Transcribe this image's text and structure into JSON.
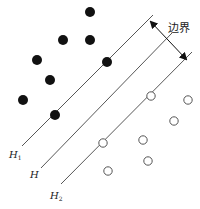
{
  "diagram": {
    "margin_label": "边界",
    "hyperplanes": [
      {
        "id": "H1",
        "label": "H",
        "subscript": "1",
        "x1": 153,
        "y1": 15,
        "x2": 22,
        "y2": 146,
        "label_x": 9,
        "label_y": 158
      },
      {
        "id": "H",
        "label": "H",
        "subscript": "",
        "x1": 172,
        "y1": 33,
        "x2": 41,
        "y2": 168,
        "label_x": 30,
        "label_y": 178
      },
      {
        "id": "H2",
        "label": "H",
        "subscript": "2",
        "x1": 192,
        "y1": 52,
        "x2": 61,
        "y2": 184,
        "label_x": 50,
        "label_y": 199
      }
    ],
    "class_positive": {
      "style": "filled",
      "color": "#111111",
      "points": [
        [
          90,
          12
        ],
        [
          63,
          40
        ],
        [
          90,
          40
        ],
        [
          37,
          60
        ],
        [
          107,
          62
        ],
        [
          50,
          80
        ],
        [
          23,
          100
        ],
        [
          55,
          115
        ]
      ]
    },
    "class_negative": {
      "style": "open",
      "color": "#555555",
      "points": [
        [
          151,
          96
        ],
        [
          188,
          100
        ],
        [
          174,
          121
        ],
        [
          103,
          143
        ],
        [
          143,
          140
        ],
        [
          148,
          161
        ],
        [
          108,
          171
        ]
      ]
    },
    "margin_arrow": {
      "x1": 151,
      "y1": 22,
      "x2": 186,
      "y2": 59
    },
    "margin_label_pos": {
      "x": 168,
      "y": 32
    }
  }
}
